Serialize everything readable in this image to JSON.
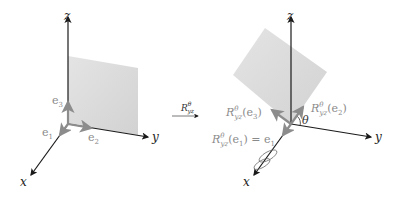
{
  "colors": {
    "axis": "#1a1a1a",
    "vector": "#8c8c8c",
    "plane": "#dcdcdc",
    "label_vector": "#8a8a8a"
  },
  "left_panel": {
    "axes": {
      "x": "x",
      "y": "y",
      "z": "z"
    },
    "vectors": {
      "e1": "e",
      "e1_sub": "1",
      "e2": "e",
      "e2_sub": "2",
      "e3": "e",
      "e3_sub": "3"
    }
  },
  "transform_arrow": {
    "label_main": "R",
    "label_sup": "θ",
    "label_sub": "yz"
  },
  "right_panel": {
    "axes": {
      "x": "x",
      "y": "y",
      "z": "z"
    },
    "angle_label": "θ",
    "vectors": {
      "r_e2": {
        "prefix": "R",
        "sup": "θ",
        "sub": "yz",
        "arg": "(e",
        "arg_sub": "2",
        "close": ")"
      },
      "r_e3": {
        "prefix": "R",
        "sup": "θ",
        "sub": "yz",
        "arg": "(e",
        "arg_sub": "3",
        "close": ")"
      },
      "r_e1": {
        "prefix": "R",
        "sup": "θ",
        "sub": "yz",
        "arg": "(e",
        "arg_sub": "1",
        "close": ") = e",
        "rhs_sub": "1"
      }
    }
  }
}
